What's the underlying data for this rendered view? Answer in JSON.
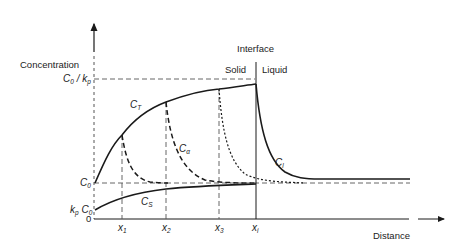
{
  "diagram": {
    "axes": {
      "y_label": "Concentration",
      "x_label": "Distance",
      "origin_label": "0"
    },
    "region_labels": {
      "interface": "Interface",
      "solid": "Solid",
      "liquid": "Liquid"
    },
    "y_ticks": [
      {
        "main": "C",
        "sub": "0",
        "suffix": " / k",
        "suffix_sub": "p",
        "meaning": "C0 / kp"
      },
      {
        "main": "C",
        "sub": "0",
        "meaning": "C0"
      },
      {
        "prefix": "k",
        "prefix_sub": "p",
        "main": " C",
        "sub": "0",
        "meaning": "kp C0"
      }
    ],
    "x_ticks": [
      {
        "main": "x",
        "sub": "1"
      },
      {
        "main": "x",
        "sub": "2"
      },
      {
        "main": "x",
        "sub": "3"
      },
      {
        "main": "x",
        "sub": "i"
      }
    ],
    "curves": [
      {
        "main": "C",
        "sub": "T",
        "style": "solid",
        "meaning": "C_T"
      },
      {
        "main": "C",
        "sub": "α",
        "style": "dashed",
        "meaning": "C_alpha"
      },
      {
        "main": "C",
        "sub": "S",
        "style": "solid",
        "meaning": "C_S"
      },
      {
        "main": "C",
        "sub": "l",
        "style": "solid",
        "meaning": "C_l"
      }
    ],
    "colors": {
      "line": "#1a1a1a",
      "guide": "#555555"
    }
  }
}
